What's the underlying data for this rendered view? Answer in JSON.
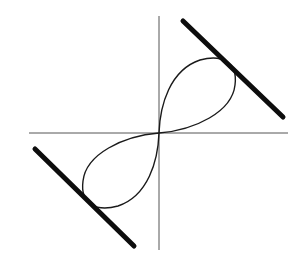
{
  "diagram": {
    "colors": {
      "background": "#ffffff",
      "axes": "#555555",
      "curve": "#1a1a1a",
      "tangent_lines": "#0d0d0d"
    },
    "axes": {
      "origin": [
        159,
        133
      ],
      "x_axis": {
        "x1": 29,
        "y1": 133,
        "x2": 288,
        "y2": 133
      },
      "y_axis": {
        "x1": 159,
        "y1": 16,
        "x2": 159,
        "y2": 250
      }
    },
    "curve": {
      "type": "figure-eight",
      "upper_loop": "M159,133 C160,105 170,70 200,60 C222,54 238,62 235,85 C232,112 195,130 159,133",
      "lower_loop": "M159,133 C158,161 148,196 118,206 C96,212 80,204 83,181 C86,154 123,136 159,133"
    },
    "tangent_lines": [
      {
        "name": "upper-right",
        "x1": 183,
        "y1": 21,
        "x2": 283,
        "y2": 117
      },
      {
        "name": "lower-left",
        "x1": 35,
        "y1": 149,
        "x2": 134,
        "y2": 246
      }
    ]
  }
}
